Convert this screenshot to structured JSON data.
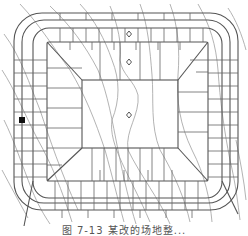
{
  "figure": {
    "caption": "图 7-13  某改的场地整...",
    "colors": {
      "road": "#555555",
      "contour": "#9a9a9a",
      "grid": "#555555",
      "marker": "#222222",
      "background": "#ffffff"
    },
    "markers": {
      "spot_elevations": [
        {
          "x": 129,
          "y": 34
        },
        {
          "x": 129,
          "y": 62
        },
        {
          "x": 129,
          "y": 115
        }
      ],
      "black_square": {
        "x": 22,
        "y": 120
      }
    }
  }
}
